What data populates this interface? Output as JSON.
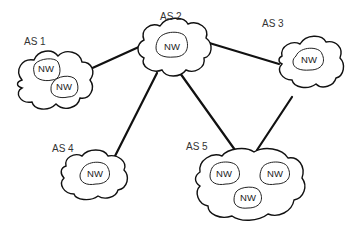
{
  "diagram": {
    "autonomous_systems": [
      {
        "id": "as1",
        "label": "AS 1",
        "networks": [
          "NW",
          "NW"
        ]
      },
      {
        "id": "as2",
        "label": "AS 2",
        "networks": [
          "NW"
        ]
      },
      {
        "id": "as3",
        "label": "AS 3",
        "networks": [
          "NW"
        ]
      },
      {
        "id": "as4",
        "label": "AS 4",
        "networks": [
          "NW"
        ]
      },
      {
        "id": "as5",
        "label": "AS 5",
        "networks": [
          "NW",
          "NW",
          "NW"
        ]
      }
    ],
    "links": [
      [
        "AS 1",
        "AS 2"
      ],
      [
        "AS 2",
        "AS 3"
      ],
      [
        "AS 2",
        "AS 4"
      ],
      [
        "AS 2",
        "AS 5"
      ],
      [
        "AS 3",
        "AS 5"
      ]
    ]
  }
}
